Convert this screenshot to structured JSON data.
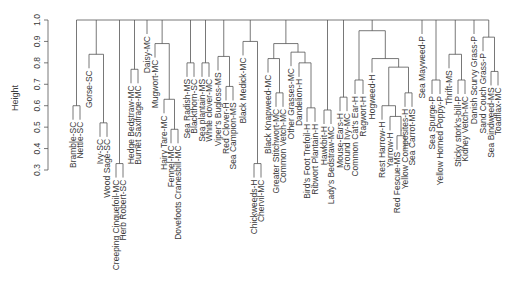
{
  "chart_data": {
    "type": "dendrogram",
    "title": "",
    "xlabel": "",
    "ylabel": "Height",
    "ylim": [
      0.3,
      1.0
    ],
    "yticks": [
      "0.3",
      "0.4",
      "0.5",
      "0.6",
      "0.7",
      "0.8",
      "0.9",
      "1.0"
    ],
    "grid": false,
    "line_color": "#555555",
    "text_color": "#3a3a3a",
    "leaves": [
      {
        "label": "Bramble-SC",
        "x": 73
      },
      {
        "label": "Nettle-SC",
        "x": 80
      },
      {
        "label": "Gorse-SC",
        "x": 89
      },
      {
        "label": "Ivy-SC",
        "x": 100
      },
      {
        "label": "Wood Sage-SC",
        "x": 107
      },
      {
        "label": "Creeping Cinquefoil-MC",
        "x": 116
      },
      {
        "label": "Herb Robert-SC",
        "x": 123
      },
      {
        "label": "Hedge Bedstraw-MC",
        "x": 131
      },
      {
        "label": "Burnet Saxifrage-MC",
        "x": 138
      },
      {
        "label": "Daisy-MC",
        "x": 147
      },
      {
        "label": "Mugwort-MC",
        "x": 155
      },
      {
        "label": "Hairy Tare-MC",
        "x": 164
      },
      {
        "label": "Fennel-MC",
        "x": 171
      },
      {
        "label": "Dovefoots Cranesbill-MC",
        "x": 178
      },
      {
        "label": "Sea Radish-MS",
        "x": 187
      },
      {
        "label": "Blackthorn-SC",
        "x": 194
      },
      {
        "label": "Sea plantain-MS",
        "x": 202
      },
      {
        "label": "White clover-MC",
        "x": 209
      },
      {
        "label": "Viper's Bugloss-MS",
        "x": 218
      },
      {
        "label": "Red Clover-H",
        "x": 226
      },
      {
        "label": "Sea Campion-MS",
        "x": 233
      },
      {
        "label": "Black Medick-MC",
        "x": 243
      },
      {
        "label": "Chickweeds-H",
        "x": 254
      },
      {
        "label": "Chervil-MC",
        "x": 261
      },
      {
        "label": "Black Knapweed-MC",
        "x": 268
      },
      {
        "label": "Greater Stitchwort-MC",
        "x": 276
      },
      {
        "label": "Common Vetch-MC",
        "x": 283
      },
      {
        "label": "Other Grasses-MC",
        "x": 291
      },
      {
        "label": "Dandelion-H",
        "x": 299
      },
      {
        "label": "Bird's Foot Trefoil-H",
        "x": 307
      },
      {
        "label": "Ribwort Plantain-H",
        "x": 315
      },
      {
        "label": "Hawkbit-H",
        "x": 324
      },
      {
        "label": "Lady's Bedstraw-MC",
        "x": 331
      },
      {
        "label": "Mouse-Ears-H",
        "x": 340
      },
      {
        "label": "Ground Ivy-MC",
        "x": 347
      },
      {
        "label": "Common Cat's Ear-H",
        "x": 355
      },
      {
        "label": "Ragwort-H",
        "x": 363
      },
      {
        "label": "Hogweed-H",
        "x": 372
      },
      {
        "label": "Rest Harrow-H",
        "x": 382
      },
      {
        "label": "Yarrow-H",
        "x": 390
      },
      {
        "label": "Red Fescue-MS",
        "x": 397
      },
      {
        "label": "Yellow Composites-H",
        "x": 405
      },
      {
        "label": "Sea Carrot-MS",
        "x": 412
      },
      {
        "label": "Sea Mayweed-P",
        "x": 422
      },
      {
        "label": "Sea Spurge-P",
        "x": 432
      },
      {
        "label": "Yellow Horned Poppy-P",
        "x": 440
      },
      {
        "label": "Thrift-MS",
        "x": 449
      },
      {
        "label": "Sticky stork's-bill-P",
        "x": 458
      },
      {
        "label": "Kidney Vetch-MC",
        "x": 465
      },
      {
        "label": "Danish Scurvy Grass-P",
        "x": 474
      },
      {
        "label": "Sand Couch Grass-P",
        "x": 483
      },
      {
        "label": "Sea Bindweed-MS",
        "x": 491
      },
      {
        "label": "Toadflax-MC",
        "x": 498
      }
    ],
    "merges": [
      {
        "id": "A",
        "children": [
          "Bramble-SC",
          "Nettle-SC"
        ],
        "height": 0.6
      },
      {
        "id": "B",
        "children": [
          "Ivy-SC",
          "Wood Sage-SC"
        ],
        "height": 0.52
      },
      {
        "id": "C",
        "children": [
          "Gorse-SC",
          "B"
        ],
        "height": 0.84
      },
      {
        "id": "D",
        "children": [
          "Creeping Cinquefoil-MC",
          "Herb Robert-SC"
        ],
        "height": 0.33
      },
      {
        "id": "E",
        "children": [
          "Hedge Bedstraw-MC",
          "Burnet Saxifrage-MC"
        ],
        "height": 0.77
      },
      {
        "id": "F",
        "children": [
          "Fennel-MC",
          "Dovefoots Cranesbill-MC"
        ],
        "height": 0.49
      },
      {
        "id": "G",
        "children": [
          "Hairy Tare-MC",
          "F"
        ],
        "height": 0.63
      },
      {
        "id": "H",
        "children": [
          "Mugwort-MC",
          "G"
        ],
        "height": 0.89
      },
      {
        "id": "I",
        "children": [
          "Sea Radish-MS",
          "Blackthorn-SC"
        ],
        "height": 0.8
      },
      {
        "id": "J",
        "children": [
          "Sea plantain-MS",
          "White clover-MC"
        ],
        "height": 0.8
      },
      {
        "id": "K",
        "children": [
          "Red Clover-H",
          "Sea Campion-MS"
        ],
        "height": 0.69
      },
      {
        "id": "L",
        "children": [
          "Viper's Bugloss-MS",
          "K"
        ],
        "height": 0.83
      },
      {
        "id": "M",
        "children": [
          "Chickweeds-H",
          "Chervil-MC"
        ],
        "height": 0.33
      },
      {
        "id": "N",
        "children": [
          "Black Medick-MC",
          "M"
        ],
        "height": 0.9
      },
      {
        "id": "O",
        "children": [
          "Greater Stitchwort-MC",
          "Common Vetch-MC"
        ],
        "height": 0.66
      },
      {
        "id": "P",
        "children": [
          "Black Knapweed-MC",
          "O"
        ],
        "height": 0.82
      },
      {
        "id": "Q",
        "children": [
          "Bird's Foot Trefoil-H",
          "Ribwort Plantain-H"
        ],
        "height": 0.59
      },
      {
        "id": "R",
        "children": [
          "Dandelion-H",
          "Q"
        ],
        "height": 0.8
      },
      {
        "id": "S",
        "children": [
          "Other Grasses-MC",
          "R"
        ],
        "height": 0.85
      },
      {
        "id": "T",
        "children": [
          "P",
          "S"
        ],
        "height": 0.89
      },
      {
        "id": "U",
        "children": [
          "Hawkbit-H",
          "Lady's Bedstraw-MC"
        ],
        "height": 0.58
      },
      {
        "id": "V",
        "children": [
          "Mouse-Ears-H",
          "Ground Ivy-MC"
        ],
        "height": 0.64
      },
      {
        "id": "W",
        "children": [
          "Common Cat's Ear-H",
          "Ragwort-H"
        ],
        "height": 0.72
      },
      {
        "id": "X",
        "children": [
          "Red Fescue-MS",
          "Yellow Composites-H"
        ],
        "height": 0.46
      },
      {
        "id": "Y",
        "children": [
          "Yarrow-H",
          "X"
        ],
        "height": 0.55
      },
      {
        "id": "Z",
        "children": [
          "Rest Harrow-H",
          "Y"
        ],
        "height": 0.6
      },
      {
        "id": "AA",
        "children": [
          "Yellow Composites-H",
          "Sea Carrot-MS"
        ],
        "height": 0.66
      },
      {
        "id": "AB",
        "children": [
          "Z",
          "AA"
        ],
        "height": 0.78
      },
      {
        "id": "AC",
        "children": [
          "Hogweed-H",
          "AB"
        ],
        "height": 0.82
      },
      {
        "id": "AD",
        "children": [
          "W",
          "AC"
        ],
        "height": 0.95
      },
      {
        "id": "AE",
        "children": [
          "Sea Spurge-P",
          "Yellow Horned Poppy-P"
        ],
        "height": 0.72
      },
      {
        "id": "AF",
        "children": [
          "Sticky stork's-bill-P",
          "Kidney Vetch-MC"
        ],
        "height": 0.72
      },
      {
        "id": "AG",
        "children": [
          "Thrift-MS",
          "AF"
        ],
        "height": 0.84
      },
      {
        "id": "AH",
        "children": [
          "Sea Bindweed-MS",
          "Toadflax-MC"
        ],
        "height": 0.76
      },
      {
        "id": "AI",
        "children": [
          "Sand Couch Grass-P",
          "AH"
        ],
        "height": 0.92
      },
      {
        "id": "ROOT",
        "children": [
          "A",
          "C",
          "D",
          "E",
          "Daisy-MC",
          "H",
          "I",
          "J",
          "L",
          "N",
          "T",
          "U",
          "V",
          "AD",
          "Sea Mayweed-P",
          "AE",
          "AG",
          "Danish Scurvy Grass-P",
          "AI"
        ],
        "height": 1.0
      }
    ]
  }
}
